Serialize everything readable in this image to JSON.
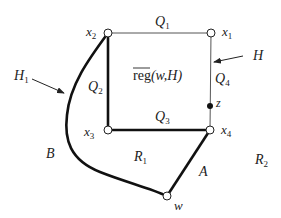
{
  "diagram": {
    "vertices": {
      "x1": {
        "label": "x",
        "sub": "1"
      },
      "x2": {
        "label": "x",
        "sub": "2"
      },
      "x3": {
        "label": "x",
        "sub": "3"
      },
      "x4": {
        "label": "x",
        "sub": "4"
      },
      "w": {
        "label": "w"
      },
      "z": {
        "label": "z"
      }
    },
    "edges": {
      "Q1": {
        "label": "Q",
        "sub": "1"
      },
      "Q2": {
        "label": "Q",
        "sub": "2"
      },
      "Q3": {
        "label": "Q",
        "sub": "3"
      },
      "Q4": {
        "label": "Q",
        "sub": "4"
      },
      "A": {
        "label": "A"
      },
      "B": {
        "label": "B"
      }
    },
    "annotations": {
      "H": {
        "label": "H"
      },
      "H1": {
        "label": "H",
        "sub": "1"
      }
    },
    "regions": {
      "R1": {
        "label": "R",
        "sub": "1"
      },
      "R2": {
        "label": "R",
        "sub": "2"
      },
      "reg": {
        "overline": "reg",
        "rest": "(w,H)"
      }
    }
  }
}
